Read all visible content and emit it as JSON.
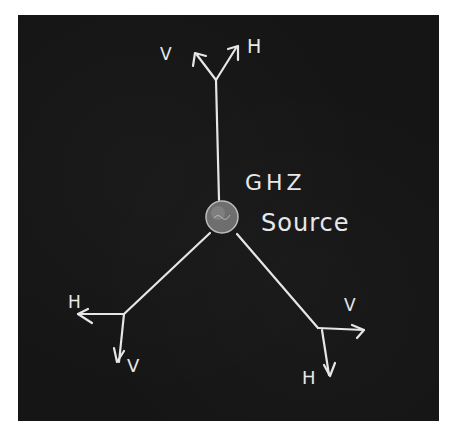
{
  "diagram": {
    "source": {
      "label_line1": "GHZ",
      "label_line2": "Source",
      "center": [
        222,
        217
      ],
      "radius": 16
    },
    "branches": [
      {
        "name": "top",
        "end": [
          216,
          80
        ],
        "axes": [
          {
            "label": "V",
            "direction": "up-left"
          },
          {
            "label": "H",
            "direction": "up-right"
          }
        ]
      },
      {
        "name": "bottom-left",
        "end": [
          124,
          314
        ],
        "axes": [
          {
            "label": "H",
            "direction": "left"
          },
          {
            "label": "V",
            "direction": "down"
          }
        ]
      },
      {
        "name": "bottom-right",
        "end": [
          318,
          328
        ],
        "axes": [
          {
            "label": "V",
            "direction": "right"
          },
          {
            "label": "H",
            "direction": "down"
          }
        ]
      }
    ],
    "colors": {
      "board": "#151515",
      "chalk": "#e6e6e6",
      "frame": "#ffffff"
    }
  }
}
